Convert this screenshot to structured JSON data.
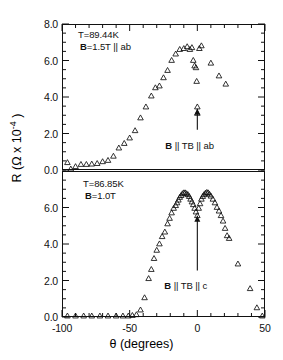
{
  "figure": {
    "axis_label_y": "R (Ω x 10",
    "axis_label_y_sup": "-4",
    "axis_label_y_close": " )",
    "axis_label_x": "θ (degrees)"
  },
  "chart_data": {
    "type": "scatter",
    "title": "",
    "xlabel": "θ (degrees)",
    "ylabel": "R (Ω x 10-4)",
    "xlim": [
      -100,
      50
    ],
    "xticks": [
      -100,
      -50,
      0,
      50
    ],
    "xtick_labels": [
      "-100",
      "-50",
      "0",
      "50"
    ],
    "xminor_step": 10,
    "grid": false,
    "legend": "none",
    "marker": "open-triangle",
    "panels": [
      {
        "id": "top",
        "ylim": [
          0.0,
          8.0
        ],
        "yticks": [
          0.0,
          2.0,
          4.0,
          6.0,
          8.0
        ],
        "ytick_labels": [
          "0.0",
          "2.0",
          "4.0",
          "6.0",
          "8.0"
        ],
        "yminor_step": 0.5,
        "annotations": [
          {
            "name": "temperature",
            "text": "T=89.44K"
          },
          {
            "name": "field",
            "text_bold": "B",
            "text": "=1.5T || ab"
          },
          {
            "name": "arrow-label",
            "text_bold": "B",
            "text": " || TB || ab"
          }
        ],
        "arrow": {
          "x": 0,
          "y_from": 2.2,
          "y_to": 3.35
        },
        "points": [
          [
            -96.0,
            0.4
          ],
          [
            -93.5,
            0.05
          ],
          [
            -90.0,
            0.18
          ],
          [
            -86.0,
            0.3
          ],
          [
            -82.0,
            0.3
          ],
          [
            -78.0,
            0.32
          ],
          [
            -74.0,
            0.35
          ],
          [
            -70.0,
            0.45
          ],
          [
            -66.0,
            0.52
          ],
          [
            -62.0,
            0.75
          ],
          [
            -58.0,
            1.2
          ],
          [
            -54.0,
            1.45
          ],
          [
            -50.0,
            1.75
          ],
          [
            -46.0,
            2.15
          ],
          [
            -42.0,
            2.85
          ],
          [
            -38.0,
            3.45
          ],
          [
            -34.0,
            4.05
          ],
          [
            -31.0,
            4.5
          ],
          [
            -28.0,
            4.6
          ],
          [
            -25.0,
            5.05
          ],
          [
            -22.0,
            5.45
          ],
          [
            -19.0,
            6.0
          ],
          [
            -16.0,
            6.35
          ],
          [
            -13.0,
            6.6
          ],
          [
            -10.0,
            6.65
          ],
          [
            -7.5,
            6.75
          ],
          [
            -5.5,
            6.6
          ],
          [
            -4.0,
            6.7
          ],
          [
            -3.0,
            6.0
          ],
          [
            -2.0,
            5.7
          ],
          [
            -1.0,
            5.6
          ],
          [
            -0.5,
            4.85
          ],
          [
            0.0,
            3.45
          ],
          [
            0.0,
            3.1
          ],
          [
            1.5,
            6.65
          ],
          [
            3.0,
            6.8
          ],
          [
            10.0,
            5.85
          ],
          [
            16.0,
            5.15
          ],
          [
            21.0,
            4.7
          ]
        ]
      },
      {
        "id": "bottom",
        "ylim": [
          0.0,
          8.0
        ],
        "yticks": [
          0.0,
          2.0,
          4.0,
          6.0
        ],
        "ytick_labels": [
          "0.0",
          "2.0",
          "4.0",
          "6.0"
        ],
        "yminor_step": 0.5,
        "annotations": [
          {
            "name": "temperature",
            "text": "T=86.85K"
          },
          {
            "name": "field",
            "text_bold": "B",
            "text": "=1.0T"
          },
          {
            "name": "arrow-label",
            "text_bold": "B",
            "text": " || TB || c"
          }
        ],
        "arrow": {
          "x": 0,
          "y_from": 2.55,
          "y_to": 5.55
        },
        "points": [
          [
            -96.0,
            0.05
          ],
          [
            -90.0,
            0.05
          ],
          [
            -84.0,
            0.05
          ],
          [
            -78.0,
            0.05
          ],
          [
            -72.0,
            0.05
          ],
          [
            -66.0,
            0.05
          ],
          [
            -60.0,
            0.05
          ],
          [
            -55.0,
            0.05
          ],
          [
            -51.0,
            0.05
          ],
          [
            -48.0,
            0.08
          ],
          [
            -45.0,
            0.12
          ],
          [
            -42.0,
            0.38
          ],
          [
            -39.0,
            1.05
          ],
          [
            -36.0,
            2.1
          ],
          [
            -34.0,
            2.6
          ],
          [
            -32.0,
            3.2
          ],
          [
            -30.0,
            3.65
          ],
          [
            -28.0,
            4.0
          ],
          [
            -26.0,
            4.4
          ],
          [
            -24.0,
            4.65
          ],
          [
            -22.0,
            5.1
          ],
          [
            -20.5,
            5.4
          ],
          [
            -19.0,
            5.7
          ],
          [
            -17.5,
            5.95
          ],
          [
            -16.0,
            6.1
          ],
          [
            -15.0,
            6.25
          ],
          [
            -14.0,
            6.4
          ],
          [
            -13.0,
            6.55
          ],
          [
            -12.0,
            6.65
          ],
          [
            -11.0,
            6.75
          ],
          [
            -10.0,
            6.8
          ],
          [
            -9.0,
            6.8
          ],
          [
            -8.0,
            6.75
          ],
          [
            -7.0,
            6.7
          ],
          [
            -6.0,
            6.6
          ],
          [
            -5.0,
            6.45
          ],
          [
            -4.0,
            6.3
          ],
          [
            -3.0,
            6.15
          ],
          [
            -2.0,
            5.95
          ],
          [
            -1.0,
            5.75
          ],
          [
            0.0,
            5.55
          ],
          [
            1.0,
            5.95
          ],
          [
            2.0,
            6.2
          ],
          [
            3.0,
            6.45
          ],
          [
            4.0,
            6.6
          ],
          [
            5.0,
            6.7
          ],
          [
            6.0,
            6.78
          ],
          [
            7.0,
            6.82
          ],
          [
            8.0,
            6.8
          ],
          [
            9.0,
            6.72
          ],
          [
            10.0,
            6.62
          ],
          [
            11.5,
            6.45
          ],
          [
            13.0,
            6.25
          ],
          [
            14.5,
            6.0
          ],
          [
            16.0,
            5.8
          ],
          [
            17.5,
            5.55
          ],
          [
            19.0,
            5.25
          ],
          [
            20.5,
            4.85
          ],
          [
            22.0,
            4.45
          ],
          [
            23.5,
            4.3
          ],
          [
            30.0,
            2.9
          ],
          [
            39.0,
            1.55
          ],
          [
            44.0,
            0.5
          ],
          [
            48.0,
            0.05
          ]
        ]
      }
    ]
  }
}
